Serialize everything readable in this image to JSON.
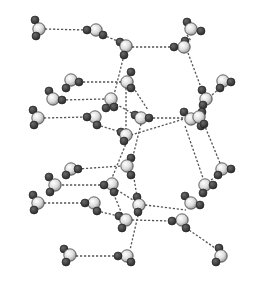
{
  "diagram": {
    "title": "",
    "colors": {
      "oxygen_fill": "#f2f2f2",
      "oxygen_shade": "#8a8a8a",
      "hydrogen_fill": "#3a3a3a",
      "bond_line": "#555555",
      "background": "#ffffff"
    },
    "atom_radius": {
      "oxygen": 6.2,
      "hydrogen": 4.0
    },
    "molecules": [
      {
        "id": "M1",
        "o": [
          39,
          29
        ],
        "h": [
          [
            35,
            20
          ],
          [
            36,
            36
          ]
        ]
      },
      {
        "id": "M2",
        "o": [
          96,
          30
        ],
        "h": [
          [
            87,
            30
          ],
          [
            103,
            35
          ]
        ]
      },
      {
        "id": "M3",
        "o": [
          126,
          46
        ],
        "h": [
          [
            124,
            55
          ],
          [
            120,
            42
          ]
        ]
      },
      {
        "id": "M4",
        "o": [
          184,
          47
        ],
        "h": [
          [
            174,
            47
          ],
          [
            185,
            41
          ]
        ]
      },
      {
        "id": "M5",
        "o": [
          191,
          29
        ],
        "h": [
          [
            187,
            22
          ],
          [
            201,
            31
          ]
        ]
      },
      {
        "id": "M6",
        "o": [
          71,
          80
        ],
        "h": [
          [
            79,
            82
          ],
          [
            66,
            88
          ]
        ]
      },
      {
        "id": "M7",
        "o": [
          127,
          82
        ],
        "h": [
          [
            131,
            72
          ],
          [
            131,
            88
          ]
        ]
      },
      {
        "id": "M8",
        "o": [
          53,
          99
        ],
        "h": [
          [
            49,
            91
          ],
          [
            62,
            100
          ]
        ]
      },
      {
        "id": "M9",
        "o": [
          111,
          99
        ],
        "h": [
          [
            114,
            107
          ],
          [
            106,
            108
          ]
        ]
      },
      {
        "id": "M10",
        "o": [
          141,
          118
        ],
        "h": [
          [
            149,
            118
          ],
          [
            135,
            115
          ]
        ]
      },
      {
        "id": "M11",
        "o": [
          206,
          99
        ],
        "h": [
          [
            202,
            90
          ],
          [
            203,
            105
          ]
        ]
      },
      {
        "id": "M12",
        "o": [
          223,
          81
        ],
        "h": [
          [
            231,
            82
          ],
          [
            220,
            88
          ]
        ]
      },
      {
        "id": "M13",
        "o": [
          38,
          118
        ],
        "h": [
          [
            33,
            110
          ],
          [
            34,
            125
          ]
        ]
      },
      {
        "id": "M14",
        "o": [
          95,
          117
        ],
        "h": [
          [
            87,
            117
          ],
          [
            97,
            125
          ]
        ]
      },
      {
        "id": "M15",
        "o": [
          126,
          135
        ],
        "h": [
          [
            121,
            132
          ],
          [
            124,
            141
          ]
        ]
      },
      {
        "id": "M16",
        "o": [
          191,
          119
        ],
        "h": [
          [
            184,
            112
          ],
          [
            201,
            126
          ]
        ]
      },
      {
        "id": "M17",
        "o": [
          199,
          117
        ],
        "h": [
          [
            202,
            112
          ],
          [
            204,
            124
          ]
        ]
      },
      {
        "id": "M18",
        "o": [
          71,
          169
        ],
        "h": [
          [
            78,
            169
          ],
          [
            66,
            175
          ]
        ]
      },
      {
        "id": "M19",
        "o": [
          127,
          166
        ],
        "h": [
          [
            131,
            158
          ],
          [
            131,
            175
          ]
        ]
      },
      {
        "id": "M20",
        "o": [
          55,
          185
        ],
        "h": [
          [
            49,
            177
          ],
          [
            50,
            192
          ]
        ]
      },
      {
        "id": "M21",
        "o": [
          112,
          184
        ],
        "h": [
          [
            104,
            185
          ],
          [
            114,
            192
          ]
        ]
      },
      {
        "id": "M22",
        "o": [
          139,
          205
        ],
        "h": [
          [
            137,
            197
          ],
          [
            138,
            212
          ]
        ]
      },
      {
        "id": "M23",
        "o": [
          205,
          185
        ],
        "h": [
          [
            203,
            193
          ],
          [
            213,
            185
          ]
        ]
      },
      {
        "id": "M24",
        "o": [
          222,
          169
        ],
        "h": [
          [
            231,
            169
          ],
          [
            218,
            175
          ]
        ]
      },
      {
        "id": "M25",
        "o": [
          38,
          203
        ],
        "h": [
          [
            33,
            195
          ],
          [
            34,
            210
          ]
        ]
      },
      {
        "id": "M26",
        "o": [
          94,
          203
        ],
        "h": [
          [
            85,
            203
          ],
          [
            97,
            211
          ]
        ]
      },
      {
        "id": "M27",
        "o": [
          126,
          220
        ],
        "h": [
          [
            119,
            216
          ],
          [
            122,
            228
          ]
        ]
      },
      {
        "id": "M28",
        "o": [
          182,
          220
        ],
        "h": [
          [
            172,
            221
          ],
          [
            186,
            228
          ]
        ]
      },
      {
        "id": "M29",
        "o": [
          191,
          203
        ],
        "h": [
          [
            185,
            196
          ],
          [
            200,
            205
          ]
        ]
      },
      {
        "id": "M30",
        "o": [
          70,
          255
        ],
        "h": [
          [
            64,
            249
          ],
          [
            66,
            262
          ]
        ]
      },
      {
        "id": "M31",
        "o": [
          127,
          256
        ],
        "h": [
          [
            118,
            256
          ],
          [
            131,
            262
          ]
        ]
      },
      {
        "id": "M32",
        "o": [
          221,
          256
        ],
        "h": [
          [
            219,
            248
          ],
          [
            216,
            262
          ]
        ]
      }
    ],
    "hbonds": [
      [
        [
          45,
          29
        ],
        [
          87,
          30
        ]
      ],
      [
        [
          103,
          35
        ],
        [
          120,
          42
        ]
      ],
      [
        [
          132,
          47
        ],
        [
          174,
          47
        ]
      ],
      [
        [
          187,
          35
        ],
        [
          191,
          41
        ]
      ],
      [
        [
          124,
          55
        ],
        [
          114,
          95
        ]
      ],
      [
        [
          188,
          53
        ],
        [
          202,
          90
        ]
      ],
      [
        [
          79,
          82
        ],
        [
          121,
          82
        ]
      ],
      [
        [
          62,
          100
        ],
        [
          105,
          99
        ]
      ],
      [
        [
          133,
          87
        ],
        [
          148,
          110
        ]
      ],
      [
        [
          116,
          104
        ],
        [
          135,
          115
        ]
      ],
      [
        [
          149,
          118
        ],
        [
          185,
          118
        ]
      ],
      [
        [
          212,
          95
        ],
        [
          220,
          88
        ]
      ],
      [
        [
          44,
          118
        ],
        [
          87,
          117
        ]
      ],
      [
        [
          97,
          125
        ],
        [
          121,
          132
        ]
      ],
      [
        [
          131,
          135
        ],
        [
          184,
          119
        ]
      ],
      [
        [
          126,
          88
        ],
        [
          126,
          129
        ]
      ],
      [
        [
          141,
          124
        ],
        [
          132,
          160
        ]
      ],
      [
        [
          204,
          124
        ],
        [
          220,
          163
        ]
      ],
      [
        [
          127,
          141
        ],
        [
          112,
          178
        ]
      ],
      [
        [
          185,
          126
        ],
        [
          203,
          178
        ]
      ],
      [
        [
          78,
          169
        ],
        [
          121,
          166
        ]
      ],
      [
        [
          62,
          185
        ],
        [
          104,
          185
        ]
      ],
      [
        [
          133,
          172
        ],
        [
          137,
          197
        ]
      ],
      [
        [
          117,
          190
        ],
        [
          133,
          200
        ]
      ],
      [
        [
          145,
          205
        ],
        [
          186,
          210
        ]
      ],
      [
        [
          211,
          180
        ],
        [
          218,
          175
        ]
      ],
      [
        [
          44,
          203
        ],
        [
          85,
          203
        ]
      ],
      [
        [
          97,
          211
        ],
        [
          119,
          216
        ]
      ],
      [
        [
          132,
          220
        ],
        [
          172,
          221
        ]
      ],
      [
        [
          112,
          190
        ],
        [
          122,
          214
        ]
      ],
      [
        [
          139,
          211
        ],
        [
          130,
          250
        ]
      ],
      [
        [
          186,
          228
        ],
        [
          218,
          250
        ]
      ],
      [
        [
          76,
          256
        ],
        [
          118,
          256
        ]
      ]
    ]
  }
}
